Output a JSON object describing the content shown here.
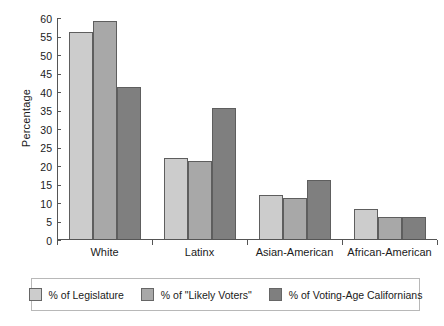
{
  "chart_data": {
    "type": "bar",
    "title": "",
    "xlabel": "",
    "ylabel": "Percentage",
    "ylim": [
      0,
      60
    ],
    "yticks": [
      0,
      5,
      10,
      15,
      20,
      25,
      30,
      35,
      40,
      45,
      50,
      55,
      60
    ],
    "grid": false,
    "legend_position": "bottom",
    "categories": [
      "White",
      "Latinx",
      "Asian-American",
      "African-American"
    ],
    "series": [
      {
        "name": "% of Legislature",
        "color": "#cccccc",
        "values": [
          56,
          22,
          12,
          8
        ]
      },
      {
        "name": "% of \"Likely Voters\"",
        "color": "#a8a8a8",
        "values": [
          59,
          21,
          11,
          6
        ]
      },
      {
        "name": "% of Voting-Age Californians",
        "color": "#7f7f7f",
        "values": [
          41,
          35.5,
          16,
          6
        ]
      }
    ]
  },
  "axis": {
    "y_label": "Percentage",
    "tick_0": "0",
    "tick_5": "5",
    "tick_10": "10",
    "tick_15": "15",
    "tick_20": "20",
    "tick_25": "25",
    "tick_30": "30",
    "tick_35": "35",
    "tick_40": "40",
    "tick_45": "45",
    "tick_50": "50",
    "tick_55": "55",
    "tick_60": "60"
  },
  "categories": {
    "c0": "White",
    "c1": "Latinx",
    "c2": "Asian-American",
    "c3": "African-American"
  },
  "legend": {
    "item0": "% of Legislature",
    "item1": "% of \"Likely Voters\"",
    "item2": "% of Voting-Age Californians"
  },
  "colors": {
    "series1": "#cccccc",
    "series2": "#a8a8a8",
    "series3": "#7f7f7f",
    "bar_border": "#5e5e5e",
    "axis": "#555555",
    "legend_border": "#b8b8b8",
    "text": "#1a1a1a"
  }
}
